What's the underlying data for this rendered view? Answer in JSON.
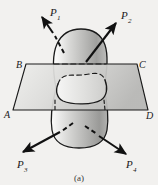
{
  "figure": {
    "caption": "(a)",
    "colors": {
      "background": "#f2f1ef",
      "outline": "#1a1a1a",
      "body_light": "#fbfbfa",
      "body_mid": "#c9c9c7",
      "body_dark": "#8e8e8c",
      "plane_light": "#e8e8e6",
      "plane_dark": "#b4b4b2",
      "label": "#1a1a1a"
    },
    "forces": [
      {
        "name": "P1",
        "letter": "P",
        "subscript": "1",
        "label": "P₁",
        "direction": "up-left",
        "tail": [
          63,
          46
        ],
        "head": [
          41,
          16
        ],
        "label_pos": [
          52,
          13
        ]
      },
      {
        "name": "P2",
        "letter": "P",
        "subscript": "2",
        "label": "P₂",
        "direction": "up-right",
        "tail": [
          88,
          58
        ],
        "head": [
          117,
          22
        ],
        "label_pos": [
          122,
          18
        ]
      },
      {
        "name": "P3",
        "letter": "P",
        "subscript": "3",
        "label": "P₃",
        "direction": "down-left",
        "tail": [
          69,
          126
        ],
        "head": [
          22,
          152
        ],
        "label_pos": [
          18,
          168
        ]
      },
      {
        "name": "P4",
        "letter": "P",
        "subscript": "4",
        "label": "P₄",
        "direction": "down-right",
        "tail": [
          89,
          131
        ],
        "head": [
          127,
          155
        ],
        "label_pos": [
          128,
          168
        ]
      }
    ],
    "section_plane": {
      "name": "cutting-plane-ABCD",
      "corners": [
        {
          "name": "B",
          "label": "B",
          "x": 26,
          "y": 64,
          "label_pos": [
            18,
            66
          ]
        },
        {
          "name": "C",
          "label": "C",
          "x": 137,
          "y": 64,
          "label_pos": [
            140,
            66
          ]
        },
        {
          "name": "D",
          "label": "D",
          "x": 148,
          "y": 110,
          "label_pos": [
            147,
            116
          ]
        },
        {
          "name": "A",
          "label": "A",
          "x": 13,
          "y": 110,
          "label_pos": [
            7,
            115
          ]
        }
      ]
    },
    "hidden_edges_style": "dashed",
    "section_curve_style": "closed wavy contour, dashed on far side"
  }
}
